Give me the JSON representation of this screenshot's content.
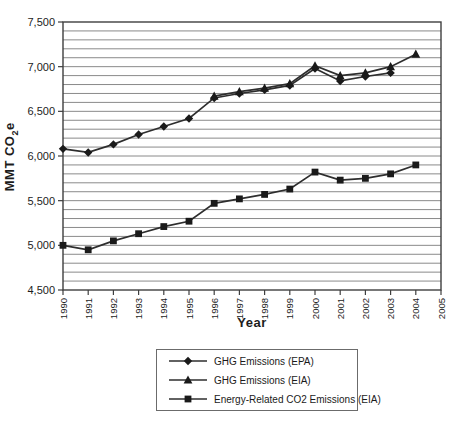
{
  "figure": {
    "background": "#ffffff"
  },
  "y_axis": {
    "title_main": "MMT CO",
    "title_sub": "2",
    "title_end": "e",
    "tick_labels": [
      "7,500",
      "7,000",
      "6,500",
      "6,000",
      "5,500",
      "5,000",
      "4,500"
    ],
    "min": 4500,
    "max": 7500,
    "major_step": 500,
    "minor_step": 100
  },
  "x_axis": {
    "title": "Year",
    "tick_labels": [
      "1990",
      "1991",
      "1992",
      "1993",
      "1994",
      "1995",
      "1996",
      "1997",
      "1998",
      "1999",
      "2000",
      "2001",
      "2002",
      "2003",
      "2004",
      "2005"
    ],
    "min": 1990,
    "max": 2005
  },
  "legend": {
    "items": [
      {
        "label": "GHG Emissions (EPA)",
        "marker": "diamond"
      },
      {
        "label": "GHG Emissions (EIA)",
        "marker": "triangle"
      },
      {
        "label": "Energy-Related CO2 Emissions (EIA)",
        "marker": "square"
      }
    ],
    "position": "bottom-center"
  },
  "colors": {
    "line": "#2e2e2e",
    "marker": "#1a1a1a",
    "gridline": "#8a8a8a",
    "axis": "#3f3f3f",
    "text": "#1c1c1c"
  },
  "chart_data": {
    "type": "line",
    "title": "",
    "xlabel": "Year",
    "ylabel": "MMT CO2e",
    "xlim": [
      1990,
      2005
    ],
    "ylim": [
      4500,
      7500
    ],
    "grid": "horizontal-minor-every-100",
    "legend_position": "bottom",
    "series": [
      {
        "name": "GHG Emissions (EPA)",
        "marker": "diamond",
        "x": [
          1990,
          1991,
          1992,
          1993,
          1994,
          1995,
          1996,
          1997,
          1998,
          1999,
          2000,
          2001,
          2002,
          2003
        ],
        "values": [
          6080,
          6040,
          6130,
          6240,
          6330,
          6420,
          6650,
          6700,
          6740,
          6790,
          6980,
          6840,
          6890,
          6930
        ]
      },
      {
        "name": "GHG Emissions (EIA)",
        "marker": "triangle",
        "x": [
          1996,
          1997,
          1998,
          1999,
          2000,
          2001,
          2002,
          2003,
          2004
        ],
        "values": [
          6670,
          6720,
          6760,
          6810,
          7010,
          6900,
          6930,
          7000,
          7140
        ]
      },
      {
        "name": "Energy-Related CO2 Emissions (EIA)",
        "marker": "square",
        "x": [
          1990,
          1991,
          1992,
          1993,
          1994,
          1995,
          1996,
          1997,
          1998,
          1999,
          2000,
          2001,
          2002,
          2003,
          2004
        ],
        "values": [
          5000,
          4950,
          5050,
          5130,
          5210,
          5270,
          5470,
          5520,
          5570,
          5630,
          5820,
          5730,
          5750,
          5800,
          5900
        ]
      }
    ]
  }
}
